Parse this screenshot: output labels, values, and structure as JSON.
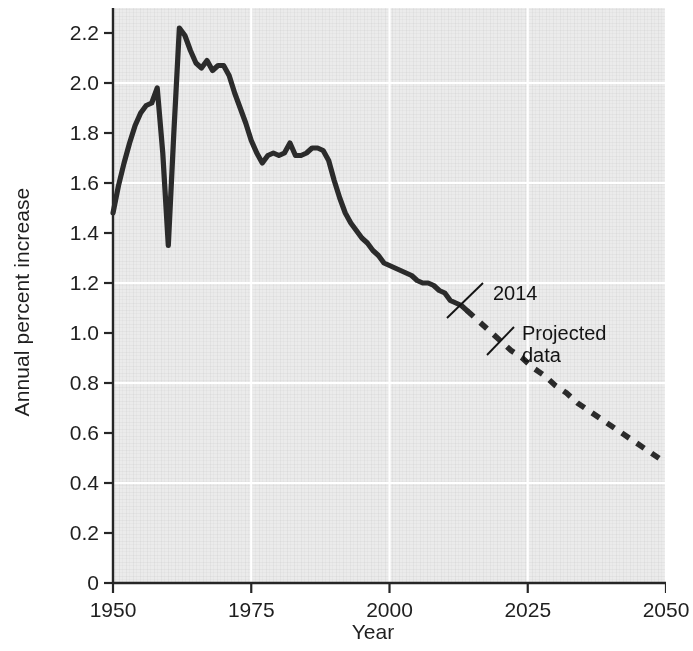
{
  "chart_data": {
    "type": "line",
    "title": "",
    "xlabel": "Year",
    "ylabel": "Annual percent increase",
    "xlim": [
      1950,
      2050
    ],
    "ylim": [
      0,
      2.3
    ],
    "xticks": [
      "1950",
      "1975",
      "2000",
      "2025",
      "2050"
    ],
    "xtick_values": [
      1950,
      1975,
      2000,
      2025,
      2050
    ],
    "yticks": [
      "0",
      "0.2",
      "0.4",
      "0.6",
      "0.8",
      "1.0",
      "1.2",
      "1.4",
      "1.6",
      "1.8",
      "2.0",
      "2.2"
    ],
    "ytick_values": [
      0,
      0.2,
      0.4,
      0.6,
      0.8,
      1.0,
      1.2,
      1.4,
      1.6,
      1.8,
      2.0,
      2.2
    ],
    "grid": true,
    "grid_color": "#ffffff",
    "plot_background": "#ebebeb",
    "line_color": "#2b2b2b",
    "legend": [],
    "series": [
      {
        "name": "Historical data",
        "style": "solid",
        "x": [
          1950,
          1951,
          1952,
          1953,
          1954,
          1955,
          1956,
          1957,
          1958,
          1959,
          1960,
          1961,
          1962,
          1963,
          1964,
          1965,
          1966,
          1967,
          1968,
          1969,
          1970,
          1971,
          1972,
          1973,
          1974,
          1975,
          1976,
          1977,
          1978,
          1979,
          1980,
          1981,
          1982,
          1983,
          1984,
          1985,
          1986,
          1987,
          1988,
          1989,
          1990,
          1991,
          1992,
          1993,
          1994,
          1995,
          1996,
          1997,
          1998,
          1999,
          2000,
          2001,
          2002,
          2003,
          2004,
          2005,
          2006,
          2007,
          2008,
          2009,
          2010,
          2011,
          2012,
          2013,
          2014
        ],
        "y": [
          1.48,
          1.59,
          1.68,
          1.76,
          1.83,
          1.88,
          1.91,
          1.92,
          1.98,
          1.72,
          1.35,
          1.8,
          2.22,
          2.19,
          2.13,
          2.08,
          2.06,
          2.09,
          2.05,
          2.07,
          2.07,
          2.03,
          1.96,
          1.9,
          1.84,
          1.77,
          1.72,
          1.68,
          1.71,
          1.72,
          1.71,
          1.72,
          1.76,
          1.71,
          1.71,
          1.72,
          1.74,
          1.74,
          1.73,
          1.69,
          1.61,
          1.54,
          1.48,
          1.44,
          1.41,
          1.38,
          1.36,
          1.33,
          1.31,
          1.28,
          1.27,
          1.26,
          1.25,
          1.24,
          1.23,
          1.21,
          1.2,
          1.2,
          1.19,
          1.17,
          1.16,
          1.13,
          1.12,
          1.11,
          1.09
        ]
      },
      {
        "name": "Projected data",
        "style": "dashed",
        "x": [
          2014,
          2016,
          2018,
          2020,
          2022,
          2024,
          2026,
          2028,
          2030,
          2032,
          2034,
          2036,
          2038,
          2040,
          2042,
          2044,
          2046,
          2048,
          2050
        ],
        "y": [
          1.09,
          1.05,
          1.01,
          0.97,
          0.93,
          0.9,
          0.86,
          0.83,
          0.79,
          0.76,
          0.72,
          0.69,
          0.66,
          0.63,
          0.6,
          0.57,
          0.54,
          0.51,
          0.48
        ]
      }
    ],
    "annotations": [
      {
        "id": "annot-2014",
        "text": "2014",
        "text_x": 493,
        "text_y": 282,
        "leader_from_x": 483,
        "leader_from_y": 283,
        "leader_to_x": 447,
        "leader_to_y": 318
      },
      {
        "id": "annot-projected-data",
        "text": "Projected\ndata",
        "text_x": 522,
        "text_y": 322,
        "leader_from_x": 514,
        "leader_from_y": 327,
        "leader_to_x": 487,
        "leader_to_y": 355
      }
    ]
  }
}
